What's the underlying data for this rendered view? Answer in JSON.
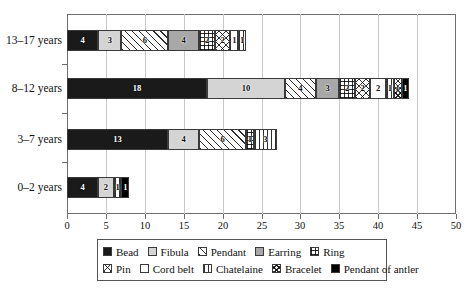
{
  "chart_data": {
    "type": "bar",
    "orientation": "horizontal",
    "stacked": true,
    "title": "",
    "xlabel": "",
    "ylabel": "",
    "xlim": [
      0,
      50
    ],
    "xticks": [
      0,
      5,
      10,
      15,
      20,
      25,
      30,
      35,
      40,
      45,
      50
    ],
    "grid": true,
    "grid_axis": "x",
    "legend_position": "bottom",
    "categories": [
      "0–2 years",
      "3–7 years",
      "8–12 years",
      "13–17 years"
    ],
    "series": [
      {
        "name": "Bead",
        "key": "bead",
        "fill": "solid-black",
        "color": "#1a1a1a",
        "values": [
          4,
          13,
          18,
          4
        ]
      },
      {
        "name": "Fibula",
        "key": "fibula",
        "fill": "solid-light",
        "color": "#d4d4d4",
        "values": [
          2,
          4,
          10,
          3
        ]
      },
      {
        "name": "Pendant",
        "key": "pendant",
        "fill": "diagonal",
        "color": "#ffffff",
        "values": [
          0,
          6,
          4,
          6
        ]
      },
      {
        "name": "Earring",
        "key": "earring",
        "fill": "solid-gray",
        "color": "#a8a8a8",
        "values": [
          0,
          0,
          3,
          4
        ]
      },
      {
        "name": "Ring",
        "key": "ring",
        "fill": "grid",
        "color": "#ffffff",
        "values": [
          0,
          1,
          2,
          2
        ]
      },
      {
        "name": "Pin",
        "key": "pin",
        "fill": "cross-diagonal",
        "color": "#ffffff",
        "values": [
          0,
          0,
          2,
          2
        ]
      },
      {
        "name": "Cord belt",
        "key": "cordbelt",
        "fill": "empty",
        "color": "#ffffff",
        "values": [
          0,
          0,
          2,
          1
        ]
      },
      {
        "name": "Chatelaine",
        "key": "chatelaine",
        "fill": "vertical",
        "color": "#ffffff",
        "values": [
          1,
          3,
          1,
          1
        ]
      },
      {
        "name": "Bracelet",
        "key": "bracelet",
        "fill": "fine-cross",
        "color": "#ffffff",
        "values": [
          0,
          0,
          1,
          0
        ]
      },
      {
        "name": "Pendant of antler",
        "key": "antler",
        "fill": "solid-black",
        "color": "#000000",
        "values": [
          1,
          0,
          1,
          0
        ]
      }
    ],
    "row_totals": [
      8,
      27,
      44,
      23
    ]
  },
  "axis": {
    "x_tick_labels": [
      "0",
      "5",
      "10",
      "15",
      "20",
      "25",
      "30",
      "35",
      "40",
      "45",
      "50"
    ],
    "y_tick_labels": [
      "13–17 years",
      "8–12 years",
      "3–7 years",
      "0–2 years"
    ]
  },
  "legend": {
    "rows": [
      [
        {
          "label": "Bead",
          "swatch": "solid-black"
        },
        {
          "label": "Fibula",
          "swatch": "solid-light"
        },
        {
          "label": "Pendant",
          "swatch": "diagonal"
        },
        {
          "label": "Earring",
          "swatch": "solid-gray"
        },
        {
          "label": "Ring",
          "swatch": "grid"
        }
      ],
      [
        {
          "label": "Pin",
          "swatch": "cross-diagonal"
        },
        {
          "label": "Cord belt",
          "swatch": "empty"
        },
        {
          "label": "Chatelaine",
          "swatch": "vertical"
        },
        {
          "label": "Bracelet",
          "swatch": "fine-cross"
        },
        {
          "label": "Pendant of antler",
          "swatch": "solid-black"
        }
      ]
    ]
  }
}
